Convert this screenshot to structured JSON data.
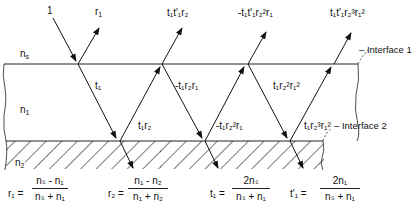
{
  "diagram": {
    "media": {
      "top": {
        "label": "n",
        "sub": "s"
      },
      "middle": {
        "label": "n",
        "sub": "1"
      },
      "bottom": {
        "label": "n",
        "sub": "2"
      }
    },
    "interfaces": [
      "– Interface 1",
      "– Interface 2"
    ],
    "beam_labels": {
      "incident": "1",
      "r1": {
        "base": "r",
        "sub": "1"
      },
      "refl_1": "t₁t'₁r₂",
      "refl_2": "-t₁t'₁r₂²r₁",
      "refl_3": "t₁t'₁r₂³r₁²",
      "internal_t1": "t₁",
      "internal_t1r2": "t₁r₂",
      "internal_neg_t1r2r1": "-t₁r₂r₁",
      "internal_neg_t1r2sq_r1": "-t₁r₂²r₁",
      "internal_t1r2sq_r1sq": "t₁r₂²r₁²",
      "internal_t1r2cu_r1sq": "t₁r₂³r₁²"
    },
    "equations": [
      {
        "lhs": "r₁ =",
        "num": "nₛ - n₁",
        "den": "nₛ + n₁"
      },
      {
        "lhs": "r₂ =",
        "num": "n₁ - n₂",
        "den": "n₁ + n₂"
      },
      {
        "lhs": "t₁ =",
        "num": "2nₛ",
        "den": "nₛ + n₁"
      },
      {
        "lhs": "t'₁ =",
        "num": "2n₁",
        "den": "nₛ + n₁"
      }
    ]
  }
}
